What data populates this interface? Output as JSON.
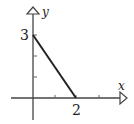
{
  "diagram": {
    "type": "coordinate-graph",
    "axes": {
      "x_label": "x",
      "y_label": "y",
      "x_tick_labels": [
        "2"
      ],
      "y_tick_labels": [
        "3"
      ]
    },
    "segment": {
      "from": [
        0,
        3
      ],
      "to": [
        2,
        0
      ]
    },
    "colors": {
      "axis": "#333333",
      "segment": "#222222"
    }
  }
}
